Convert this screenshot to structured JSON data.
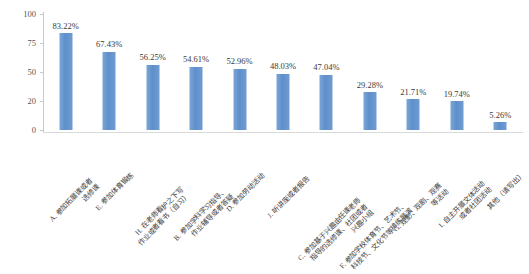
{
  "chart_data": {
    "type": "bar",
    "title": "",
    "subtitle": "",
    "xlabel": "",
    "ylabel": "",
    "grid": false,
    "legend": "none",
    "ylim": [
      0,
      100
    ],
    "ytick_labels": [
      "100",
      "75",
      "50",
      "20",
      "0"
    ],
    "ytick_values": [
      100,
      75,
      50,
      20,
      0
    ],
    "bar_color": "#6a9ad4",
    "axis_color": "#c8c8c8",
    "categories": [
      "A. 参加拓展课或者\n选修课",
      "E. 参加体育锻炼",
      "H. 在老师看护之下写\n作业或者看书（自习）",
      "B. 参加学科学习指导、\n作业辅导或者答疑",
      "D. 参加劳动活动",
      "J. 听讲座或者报告",
      "C. 参加基于兴趣由任课老师\n指导的选修课、社团或者\n兴趣小组",
      "F. 参加学校体育节、艺术节、\n科技节、文化节等排练展演",
      "G. 观影、观剧、观赛\n等活动",
      "I. 自主开展文体活动\n或者社团活动",
      "其他（请写出）"
    ],
    "category_lines": [
      [
        "A. 参加拓展课或者",
        "选修课"
      ],
      [
        "E. 参加体育锻炼"
      ],
      [
        "H. 在老师看护之下写",
        "作业或者看书（自习）"
      ],
      [
        "B. 参加学科学习指导、",
        "作业辅导或者答疑"
      ],
      [
        "D. 参加劳动活动"
      ],
      [
        "J. 听讲座或者报告"
      ],
      [
        "C. 参加基于兴趣由任课老师",
        "指导的选修课、社团或者",
        "兴趣小组"
      ],
      [
        "F. 参加学校体育节、艺术节、",
        "科技节、文化节等排练展演"
      ],
      [
        "G. 观影、观剧、观赛",
        "等活动"
      ],
      [
        "I. 自主开展文体活动",
        "或者社团活动"
      ],
      [
        "其他（请写出）"
      ]
    ],
    "values": [
      83.22,
      67.43,
      56.25,
      54.61,
      52.96,
      48.03,
      47.04,
      29.28,
      21.71,
      19.74,
      5.26
    ],
    "value_labels": [
      "83.22%",
      "67.43%",
      "56.25%",
      "54.61%",
      "52.96%",
      "48.03%",
      "47.04%",
      "29.28%",
      "21.71%",
      "19.74%",
      "5.26%"
    ]
  }
}
